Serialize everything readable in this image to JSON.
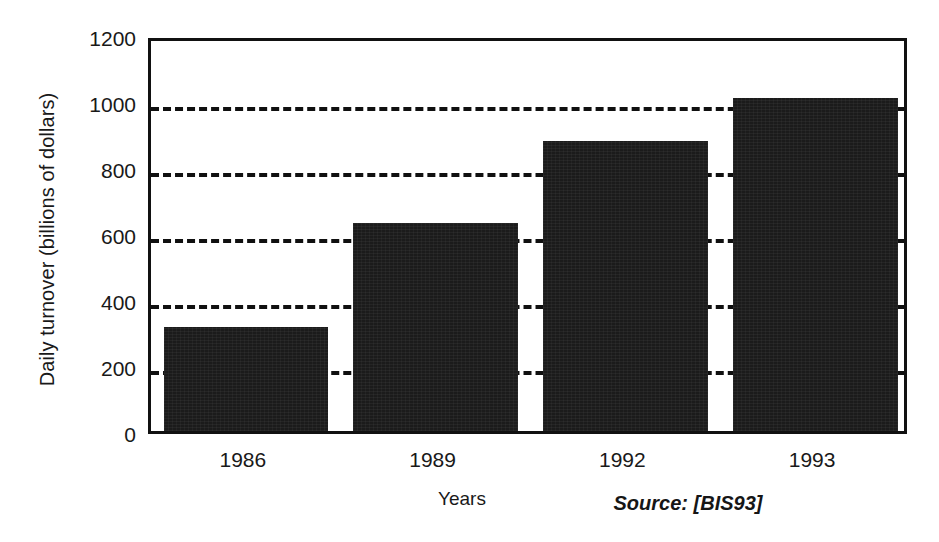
{
  "chart_data": {
    "type": "bar",
    "title": "",
    "subtitle": "",
    "categories": [
      "1986",
      "1989",
      "1992",
      "1993"
    ],
    "values": [
      315,
      630,
      880,
      1010
    ],
    "xlabel": "Years",
    "ylabel": "Daily turnover (billions of dollars)",
    "ylim": [
      0,
      1200
    ],
    "yticks": [
      0,
      200,
      400,
      600,
      800,
      1000,
      1200
    ],
    "ytick_labels": [
      "0",
      "200",
      "400",
      "600",
      "800",
      "1000",
      "1200"
    ],
    "gridlines": [
      200,
      400,
      600,
      800,
      1000
    ],
    "grid": true,
    "grid_style": "dashed",
    "legend": false,
    "legend_position": "none",
    "annotations": [
      {
        "text": "Source: [BIS93]",
        "style": "italic",
        "position": "below-axis-right"
      }
    ],
    "bar_color": "#1b1b1b",
    "axis_color": "#111111",
    "background_color": "#ffffff"
  },
  "axes": {
    "y_title": "Daily turnover (billions of dollars)",
    "x_title": "Years"
  },
  "notes": {
    "source": "Source: [BIS93]"
  }
}
